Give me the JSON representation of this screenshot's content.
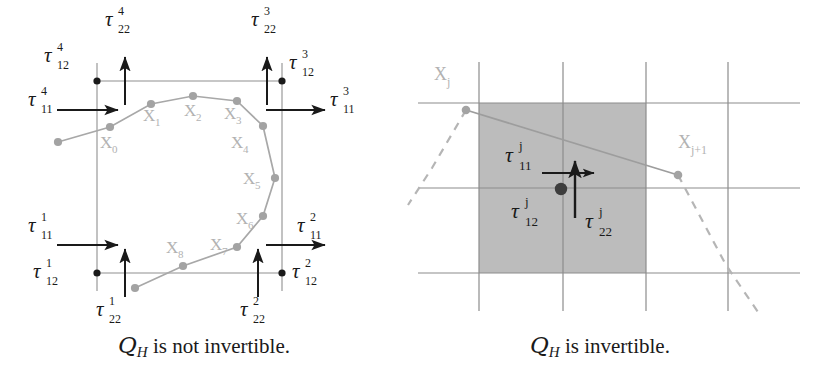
{
  "figure": {
    "title_absent": true,
    "panels": [
      {
        "id": "left-panel",
        "caption_prefix": "Q",
        "caption_sub": "H",
        "caption_text": " is not invertible.",
        "caption_full": "Q_H is not invertible.",
        "cell": {
          "corner_labels": [
            {
              "name": "tau-12-4",
              "tau": "τ",
              "sub": "12",
              "sup": "4",
              "x": 44,
              "y": 48
            },
            {
              "name": "tau-22-4",
              "tau": "τ",
              "sub": "22",
              "sup": "4",
              "x": 105,
              "y": 10
            },
            {
              "name": "tau-11-4",
              "tau": "τ",
              "sub": "11",
              "sup": "4",
              "x": 28,
              "y": 92
            },
            {
              "name": "tau-22-3",
              "tau": "τ",
              "sub": "22",
              "sup": "3",
              "x": 251,
              "y": 10
            },
            {
              "name": "tau-12-3",
              "tau": "τ",
              "sub": "12",
              "sup": "3",
              "x": 293,
              "y": 55
            },
            {
              "name": "tau-11-3",
              "tau": "τ",
              "sub": "11",
              "sup": "3",
              "x": 327,
              "y": 92
            },
            {
              "name": "tau-11-1",
              "tau": "τ",
              "sub": "11",
              "sup": "1",
              "x": 28,
              "y": 218
            },
            {
              "name": "tau-12-1",
              "tau": "τ",
              "sub": "12",
              "sup": "1",
              "x": 33,
              "y": 264
            },
            {
              "name": "tau-22-1",
              "tau": "τ",
              "sub": "22",
              "sup": "1",
              "x": 96,
              "y": 300
            },
            {
              "name": "tau-11-2",
              "tau": "τ",
              "sub": "11",
              "sup": "2",
              "x": 300,
              "y": 218
            },
            {
              "name": "tau-12-2",
              "tau": "τ",
              "sub": "12",
              "sup": "2",
              "x": 295,
              "y": 264
            },
            {
              "name": "tau-22-2",
              "tau": "τ",
              "sub": "22",
              "sup": "2",
              "x": 240,
              "y": 300
            }
          ],
          "vertex_labels": [
            {
              "name": "vertex-label-x0",
              "base": "X",
              "sub": "0",
              "x": 103,
              "y": 140
            },
            {
              "name": "vertex-label-x1",
              "base": "X",
              "sub": "1",
              "x": 148,
              "y": 112
            },
            {
              "name": "vertex-label-x2",
              "base": "X",
              "sub": "2",
              "x": 186,
              "y": 107
            },
            {
              "name": "vertex-label-x3",
              "base": "X",
              "sub": "3",
              "x": 226,
              "y": 110
            },
            {
              "name": "vertex-label-x4",
              "base": "X",
              "sub": "4",
              "x": 234,
              "y": 140
            },
            {
              "name": "vertex-label-x5",
              "base": "X",
              "sub": "5",
              "x": 243,
              "y": 178
            },
            {
              "name": "vertex-label-x6",
              "base": "X",
              "sub": "6",
              "x": 237,
              "y": 219
            },
            {
              "name": "vertex-label-x7",
              "base": "X",
              "sub": "7",
              "x": 212,
              "y": 246
            },
            {
              "name": "vertex-label-x8",
              "base": "X",
              "sub": "8",
              "x": 168,
              "y": 248
            }
          ],
          "box": {
            "left": 97,
            "top": 81,
            "right": 282,
            "bottom": 273
          },
          "polygon_points": "58,142 110,127 151,104 193,96 237,101 263,126 275,178 263,216 237,247 183,266 135,288",
          "nodes": [
            [
              58,
              142
            ],
            [
              110,
              127
            ],
            [
              151,
              104
            ],
            [
              193,
              96
            ],
            [
              237,
              101
            ],
            [
              263,
              126
            ],
            [
              275,
              178
            ],
            [
              263,
              216
            ],
            [
              237,
              247
            ],
            [
              183,
              266
            ],
            [
              135,
              288
            ]
          ]
        }
      },
      {
        "id": "right-panel",
        "caption_prefix": "Q",
        "caption_sub": "H",
        "caption_text": " is invertible.",
        "caption_full": "Q_H is invertible.",
        "cell": {
          "grid_v_x": [
            479,
            563,
            646,
            728
          ],
          "grid_h_y": [
            103,
            188,
            273
          ],
          "grid_v_top": 62,
          "grid_v_bottom": 311,
          "grid_h_left": 418,
          "grid_h_right": 800,
          "shaded": {
            "left": 479,
            "top": 103,
            "right": 646,
            "bottom": 273
          },
          "shade_color": "#bcbcbc",
          "node_xj": [
            466,
            110
          ],
          "node_xj1": [
            678,
            175
          ],
          "center_dot": [
            561,
            189
          ],
          "labels": [
            {
              "name": "vertex-label-xj",
              "base": "X",
              "sub": "j",
              "x": 436,
              "y": 68
            },
            {
              "name": "vertex-label-xj1",
              "base": "X",
              "sub": "j+1",
              "x": 680,
              "y": 135
            },
            {
              "name": "tau-11-j",
              "tau": "τ",
              "sub": "11",
              "sup": "j",
              "x": 508,
              "y": 147
            },
            {
              "name": "tau-12-j",
              "tau": "τ",
              "sub": "12",
              "sup": "j",
              "x": 513,
              "y": 210
            },
            {
              "name": "tau-22-j",
              "tau": "τ",
              "sub": "22",
              "sup": "j",
              "x": 585,
              "y": 218
            }
          ]
        }
      }
    ],
    "colors": {
      "ink": "#1a1a1a",
      "grid_line": "#8c8c8c",
      "polygon_line": "#a0a0a0",
      "node_fill": "#a3a3a3",
      "shade": "#bcbcbc",
      "label_gray": "#b2b2b2",
      "dashed": "#b5b5b5"
    }
  }
}
